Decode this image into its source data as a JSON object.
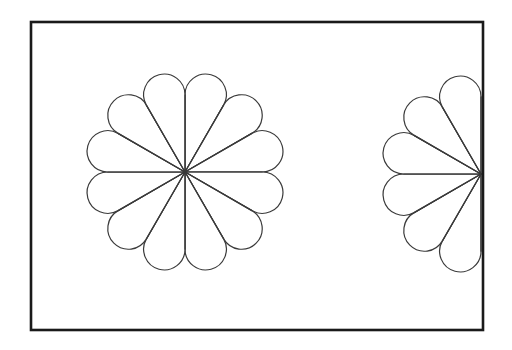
{
  "canvas": {
    "width": 512,
    "height": 350,
    "background_color": "#ffffff"
  },
  "frame": {
    "label": "Rectangular border frame",
    "x": 31,
    "y": 22,
    "width": 452,
    "height": 308,
    "stroke_color": "#1a1a1a",
    "stroke_width": 2.6,
    "fill": "none"
  },
  "style": {
    "line_color": "#3a3a3a",
    "line_width": 1.2,
    "petal_fill": "#ffffff"
  },
  "figures": [
    {
      "id": "full-rosette",
      "label": "Full twelve petal rosette",
      "center_x": 185,
      "center_y": 172,
      "outer_radius": 130,
      "petal_count": 12,
      "spoke_count": 12,
      "start_angle_deg": -90,
      "sweep_deg": 360,
      "petal_half_angle_deg": 15,
      "petal_tip_ratio": 0.615,
      "clipped": false
    },
    {
      "id": "half-rosette",
      "label": "Half six petal rosette on right border",
      "center_x": 481,
      "center_y": 174,
      "outer_radius": 130,
      "petal_count": 6,
      "spoke_count": 7,
      "start_angle_deg": 90,
      "sweep_deg": 180,
      "petal_half_angle_deg": 15,
      "petal_tip_ratio": 0.615,
      "clipped": true,
      "clip_edge": "right-border"
    }
  ],
  "chart_data": {
    "type": "diagram",
    "title": "",
    "shapes": [
      {
        "name": "full-rosette",
        "petals": 12,
        "radial_lines": 12,
        "angle_between_petals_deg": 30
      },
      {
        "name": "half-rosette",
        "petals": 6,
        "radial_lines": 7,
        "angle_between_petals_deg": 30
      }
    ]
  }
}
